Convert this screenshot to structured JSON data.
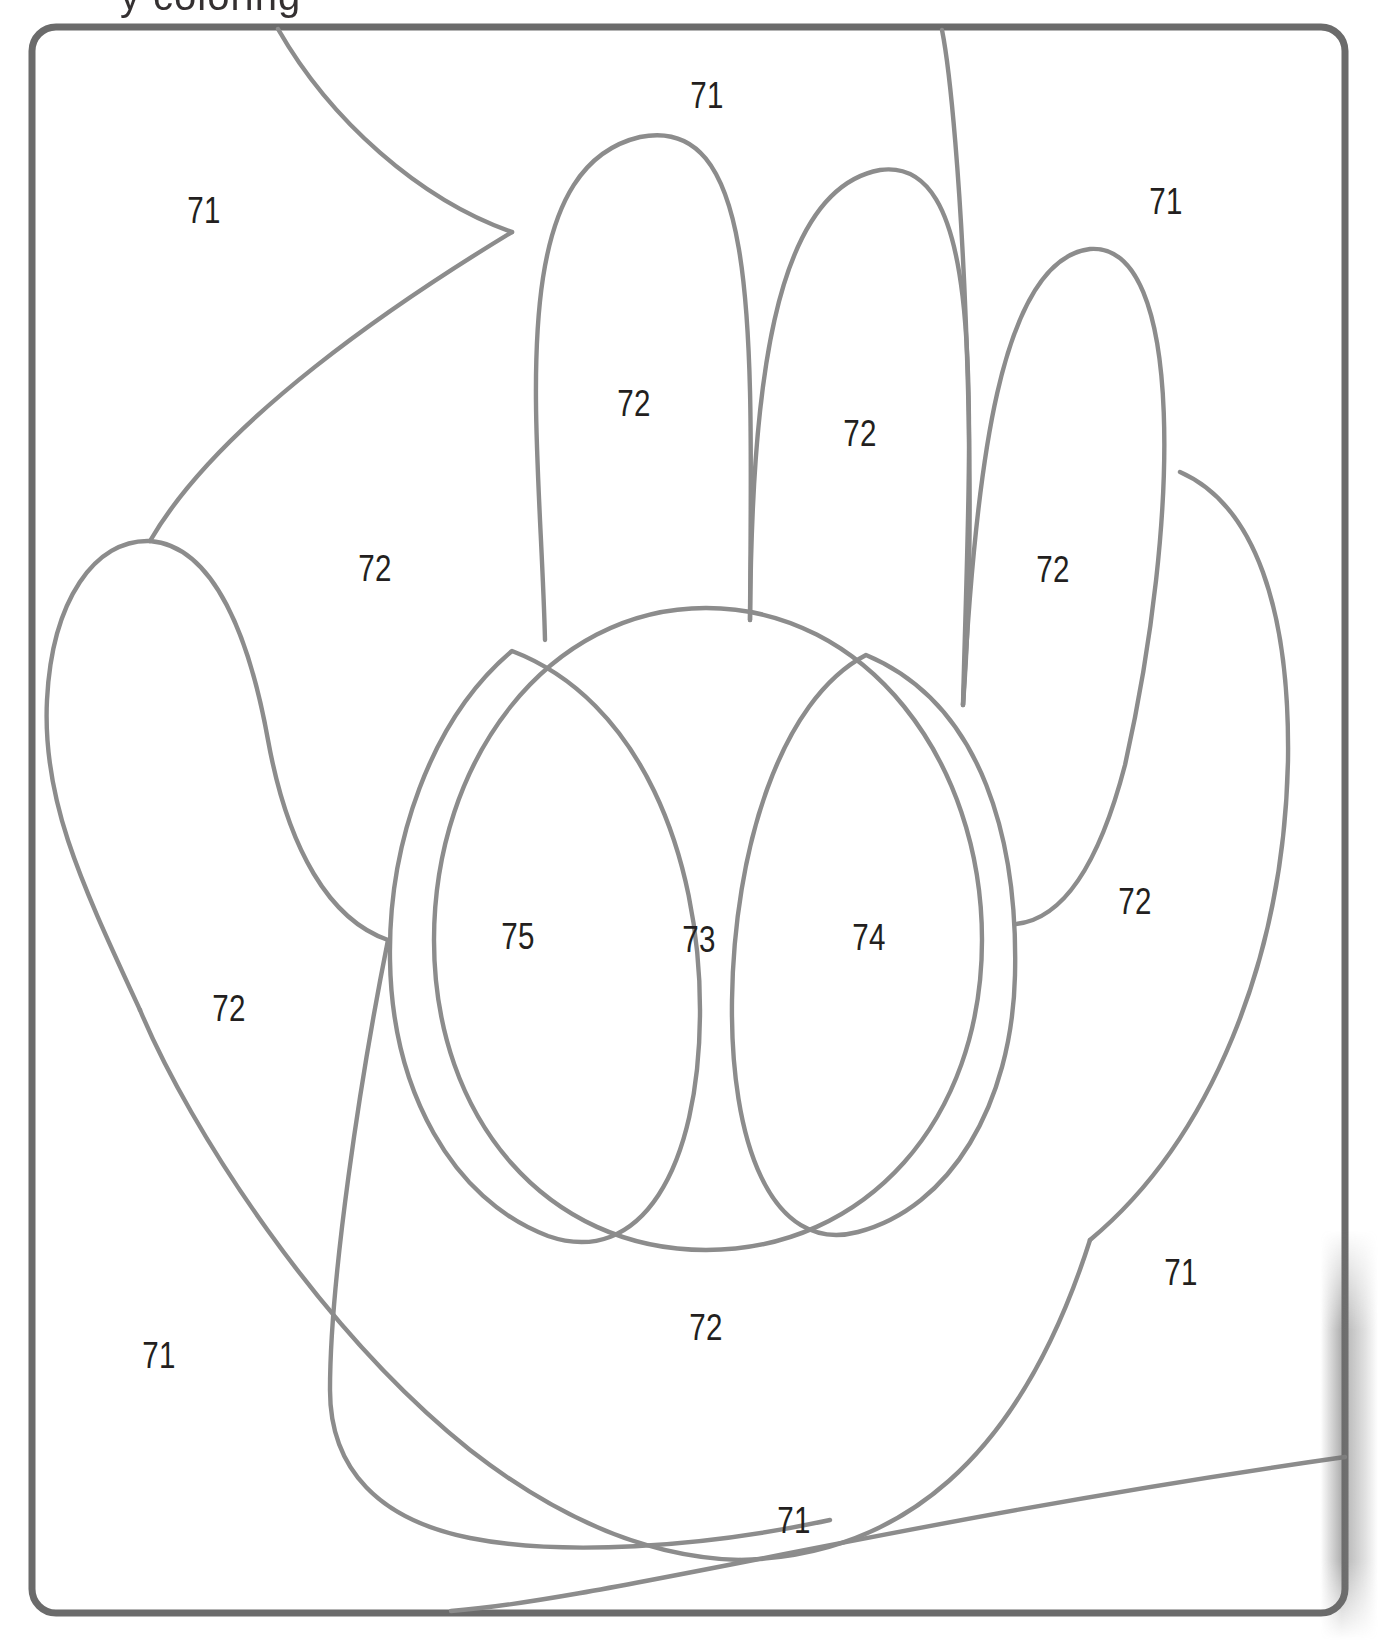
{
  "page": {
    "title_fragment": "y   coloring",
    "background_color": "#ffffff",
    "border_color": "#6b6b6b",
    "stroke_color": "#8c8c8c",
    "label_color": "#231f20",
    "width": 1378,
    "height": 1650
  },
  "artwork": {
    "name": "hand-palm-line-art",
    "description": "Line drawing of an open hand / mitt divided into numbered color regions"
  },
  "regions": [
    {
      "id": "r1",
      "number": "71",
      "x": 204,
      "y": 211,
      "area": "upper-left-background"
    },
    {
      "id": "r2",
      "number": "71",
      "x": 707,
      "y": 96,
      "area": "top-center-background"
    },
    {
      "id": "r3",
      "number": "71",
      "x": 1166,
      "y": 202,
      "area": "upper-right-background"
    },
    {
      "id": "r4",
      "number": "72",
      "x": 634,
      "y": 404,
      "area": "index-finger"
    },
    {
      "id": "r5",
      "number": "72",
      "x": 860,
      "y": 434,
      "area": "middle-finger"
    },
    {
      "id": "r6",
      "number": "72",
      "x": 375,
      "y": 569,
      "area": "palm-upper-left"
    },
    {
      "id": "r7",
      "number": "72",
      "x": 1053,
      "y": 570,
      "area": "ring-finger"
    },
    {
      "id": "r8",
      "number": "72",
      "x": 1135,
      "y": 902,
      "area": "right-outer-palm"
    },
    {
      "id": "r9",
      "number": "75",
      "x": 518,
      "y": 937,
      "area": "left-inner-oval"
    },
    {
      "id": "r10",
      "number": "73",
      "x": 699,
      "y": 940,
      "area": "center-palm-wedge"
    },
    {
      "id": "r11",
      "number": "74",
      "x": 869,
      "y": 938,
      "area": "right-inner-oval"
    },
    {
      "id": "r12",
      "number": "72",
      "x": 229,
      "y": 1009,
      "area": "thumb"
    },
    {
      "id": "r13",
      "number": "71",
      "x": 1181,
      "y": 1273,
      "area": "lower-right-background"
    },
    {
      "id": "r14",
      "number": "72",
      "x": 706,
      "y": 1328,
      "area": "lower-center-palm"
    },
    {
      "id": "r15",
      "number": "71",
      "x": 159,
      "y": 1356,
      "area": "lower-left-background"
    },
    {
      "id": "r16",
      "number": "71",
      "x": 794,
      "y": 1521,
      "area": "bottom-strip-background"
    }
  ],
  "legend_numbers": [
    "71",
    "72",
    "73",
    "74",
    "75"
  ]
}
